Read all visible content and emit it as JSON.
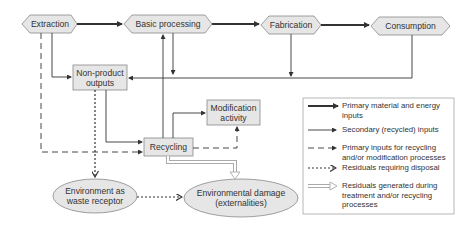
{
  "nodes": {
    "extraction": "Extraction",
    "basic_processing": "Basic processing",
    "fabrication": "Fabrication",
    "consumption": "Consumption",
    "non_product_outputs": "Non-product outputs",
    "modification_activity": "Modification activity",
    "recycling": "Recycling",
    "environment_waste_receptor": "Environment as waste receptor",
    "environmental_damage": "Environmental damage (externalities)"
  },
  "legend": [
    {
      "style": "thick-solid",
      "label": "Primary material and energy inputs"
    },
    {
      "style": "thin-solid",
      "label": "Secondary (recycled) inputs"
    },
    {
      "style": "dashed",
      "label": "Primary inputs for recycling and/or modification processes"
    },
    {
      "style": "dotted",
      "label": "Residuals requiring disposal"
    },
    {
      "style": "hollow-double",
      "label": "Residuals generated during treatment and/or recycling processes"
    }
  ],
  "colors": {
    "box_fill": "#e6e6e6",
    "box_stroke": "#888888",
    "line": "#333333",
    "hollow": "#bbbbbb"
  }
}
